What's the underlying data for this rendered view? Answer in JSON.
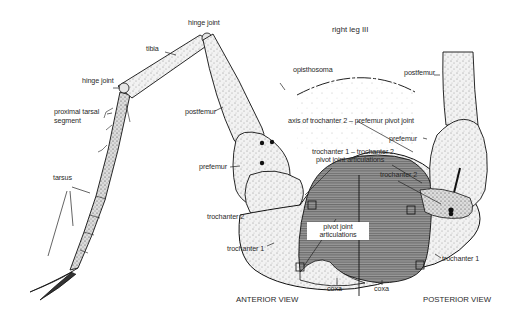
{
  "figure": {
    "title": "right leg III",
    "views": [
      "ANTERIOR VIEW",
      "POSTERIOR VIEW"
    ]
  },
  "labels": {
    "hinge_joint_top": "hinge joint",
    "tibia": "tibia",
    "hinge_joint_mid": "hinge joint",
    "proximal_tarsal_segment_1": "proximal tarsal",
    "proximal_tarsal_segment_2": "segment",
    "postfemur_left": "postfemur",
    "prefemur_left": "prefemur",
    "tarsus": "tarsus",
    "trochanter2_left": "trochanter 2",
    "trochanter1_left": "trochanter 1",
    "opisthosoma": "opisthosoma",
    "postfemur_right": "postfemur",
    "axis_label": "axis of trochanter 2 – prefemur pivot joint",
    "prefemur_right": "prefemur",
    "t1t2_line1": "trochanter 1 – trochanter 2",
    "t1t2_line2": "pivot joint articulations",
    "trochanter2_right": "trochanter 2",
    "pivot_joint_articulations": "pivot joint articulations",
    "trochanter1_right": "trochanter 1",
    "coxa_left": "coxa",
    "coxa_right": "coxa",
    "anterior_view": "ANTERIOR VIEW",
    "posterior_view": "POSTERIOR VIEW",
    "right_leg": "right leg III"
  },
  "colors": {
    "ink": "#1a1a1a",
    "stipple_fill": "#e9e9e9",
    "coxa_hatch": "#7a7a7a",
    "background": "#ffffff"
  }
}
